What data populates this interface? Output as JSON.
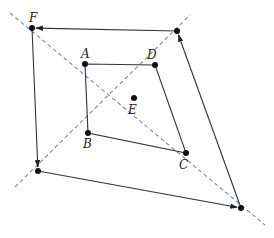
{
  "diagram": {
    "colors": {
      "line": "#333333",
      "dashed": "#7a82c8",
      "point": "#111111",
      "background": "#ffffff"
    },
    "points": {
      "F": {
        "x": 32,
        "y": 28,
        "label": "F"
      },
      "G": {
        "x": 177,
        "y": 31,
        "label": ""
      },
      "A": {
        "x": 85,
        "y": 64,
        "label": "A"
      },
      "D": {
        "x": 155,
        "y": 65,
        "label": "D"
      },
      "E": {
        "x": 134,
        "y": 98,
        "label": "E"
      },
      "B": {
        "x": 88,
        "y": 133,
        "label": "B"
      },
      "C": {
        "x": 186,
        "y": 153,
        "label": "C"
      },
      "H": {
        "x": 38,
        "y": 171,
        "label": ""
      },
      "I": {
        "x": 241,
        "y": 208,
        "label": ""
      }
    },
    "labels": {
      "F": "F",
      "A": "A",
      "D": "D",
      "E": "E",
      "B": "B",
      "C": "C"
    },
    "inner_quadrilateral": [
      "A",
      "B",
      "C",
      "D"
    ],
    "outer_arrows": [
      {
        "from": "G",
        "to": "F"
      },
      {
        "from": "F",
        "to": "H"
      },
      {
        "from": "H",
        "to": "I"
      },
      {
        "from": "I",
        "to": "G"
      }
    ],
    "dashed_lines": [
      {
        "x1": 10,
        "y1": 13,
        "x2": 265,
        "y2": 225
      },
      {
        "x1": 15,
        "y1": 187,
        "x2": 190,
        "y2": 15
      }
    ]
  }
}
